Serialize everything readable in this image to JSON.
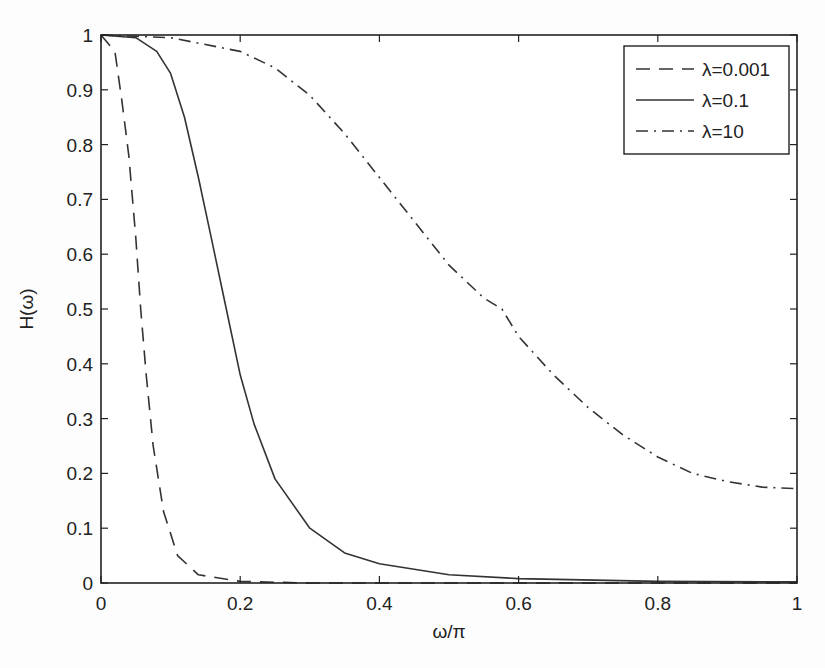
{
  "chart_data": {
    "type": "line",
    "title": "",
    "xlabel": "ω/π",
    "ylabel": "H(ω)",
    "xlim": [
      0,
      1
    ],
    "ylim": [
      0,
      1
    ],
    "grid": false,
    "legend_position": "upper right",
    "x_ticks": [
      "0",
      "0.2",
      "0.4",
      "0.6",
      "0.8",
      "1"
    ],
    "y_ticks": [
      "0",
      "0.1",
      "0.2",
      "0.3",
      "0.4",
      "0.5",
      "0.6",
      "0.7",
      "0.8",
      "0.9",
      "1"
    ],
    "series": [
      {
        "name": "λ=0.001",
        "style": "dashed",
        "x": [
          0,
          0.02,
          0.03,
          0.04,
          0.05,
          0.057,
          0.065,
          0.075,
          0.09,
          0.11,
          0.14,
          0.2,
          0.3,
          1
        ],
        "y": [
          1,
          0.97,
          0.88,
          0.78,
          0.63,
          0.5,
          0.38,
          0.25,
          0.13,
          0.05,
          0.015,
          0.003,
          0,
          0
        ]
      },
      {
        "name": "λ=0.1",
        "style": "solid",
        "x": [
          0,
          0.05,
          0.08,
          0.1,
          0.12,
          0.14,
          0.16,
          0.18,
          0.2,
          0.22,
          0.25,
          0.3,
          0.35,
          0.4,
          0.5,
          0.6,
          0.8,
          1
        ],
        "y": [
          1,
          0.995,
          0.97,
          0.93,
          0.85,
          0.74,
          0.62,
          0.5,
          0.38,
          0.29,
          0.19,
          0.1,
          0.055,
          0.035,
          0.015,
          0.008,
          0.003,
          0.002
        ]
      },
      {
        "name": "λ=10",
        "style": "dash-dot",
        "x": [
          0,
          0.1,
          0.2,
          0.25,
          0.3,
          0.35,
          0.4,
          0.45,
          0.5,
          0.55,
          0.576,
          0.6,
          0.65,
          0.7,
          0.75,
          0.8,
          0.85,
          0.9,
          0.95,
          1
        ],
        "y": [
          1,
          0.995,
          0.97,
          0.94,
          0.89,
          0.82,
          0.74,
          0.66,
          0.58,
          0.52,
          0.5,
          0.45,
          0.38,
          0.32,
          0.27,
          0.23,
          0.2,
          0.185,
          0.175,
          0.172
        ]
      }
    ]
  },
  "legend": {
    "items": [
      {
        "label": "λ=0.001",
        "style": "dashed"
      },
      {
        "label": "λ=0.1",
        "style": "solid"
      },
      {
        "label": "λ=10",
        "style": "dash-dot"
      }
    ]
  },
  "colors": {
    "line": "#333333",
    "axis": "#222222",
    "background": "#fdfdfd"
  }
}
